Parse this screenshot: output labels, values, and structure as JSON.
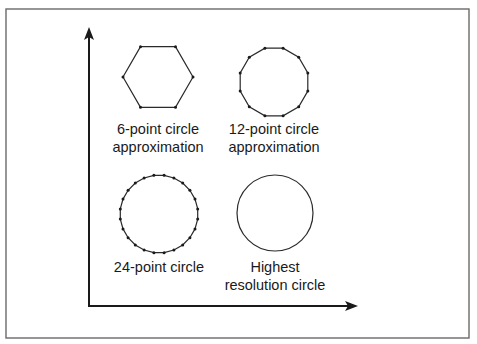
{
  "diagram": {
    "frame": {
      "x": 6,
      "y": 9,
      "width": 463,
      "height": 329,
      "color": "#6a6a6a"
    },
    "axes": {
      "origin": [
        89,
        306
      ],
      "y_axis_top": 27,
      "x_axis_right": 358,
      "color": "#1a1a1a"
    },
    "shapes": [
      {
        "id": "hexagon",
        "type": "polygon",
        "sides": 6,
        "center": [
          158,
          77
        ],
        "radius": 35,
        "rotation_deg": 0,
        "show_vertices": true,
        "label_lines": [
          "6-point circle",
          "approximation"
        ],
        "label_x": 158,
        "label_y": [
          134,
          152
        ]
      },
      {
        "id": "dodecagon",
        "type": "polygon",
        "sides": 12,
        "center": [
          274,
          82
        ],
        "radius": 35,
        "rotation_deg": 15,
        "show_vertices": true,
        "label_lines": [
          "12-point circle",
          "approximation"
        ],
        "label_x": 274,
        "label_y": [
          134,
          152
        ]
      },
      {
        "id": "icositetragon",
        "type": "polygon",
        "sides": 24,
        "center": [
          159,
          214
        ],
        "radius": 39,
        "rotation_deg": 7.5,
        "show_vertices": true,
        "label_lines": [
          "24-point circle"
        ],
        "label_x": 159,
        "label_y": [
          272
        ]
      },
      {
        "id": "circle",
        "type": "circle",
        "center": [
          275,
          213
        ],
        "radius": 38,
        "show_vertices": false,
        "label_lines": [
          "Highest",
          "resolution circle"
        ],
        "label_x": 275,
        "label_y": [
          272,
          290
        ]
      }
    ]
  }
}
